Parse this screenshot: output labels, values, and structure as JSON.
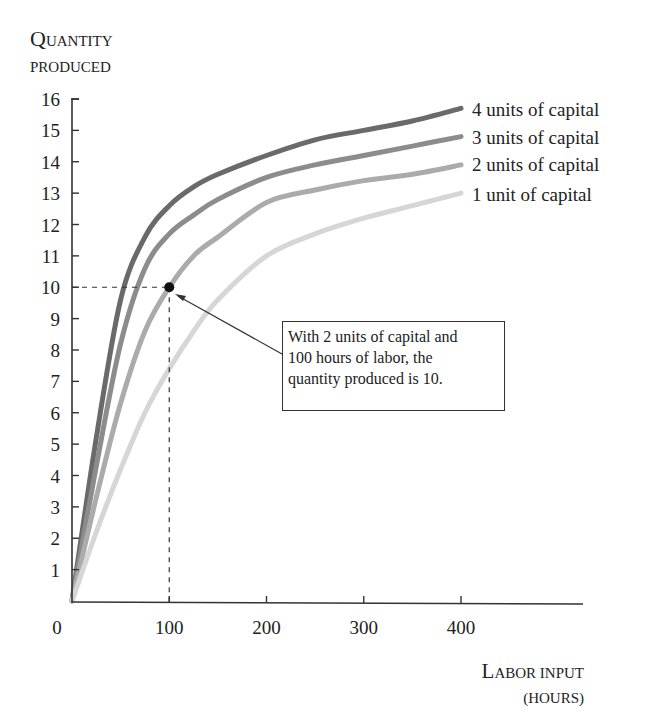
{
  "chart_data": {
    "type": "line",
    "title": "",
    "ylabel": "Quantity produced",
    "ylabel_lines": [
      "QUANTITY",
      "PRODUCED"
    ],
    "xlabel": "Labor input (hours)",
    "xlabel_lines": [
      "LABOR INPUT",
      "(HOURS)"
    ],
    "xlim": [
      0,
      520
    ],
    "ylim": [
      0,
      16
    ],
    "x_ticks": [
      0,
      100,
      200,
      300,
      400
    ],
    "y_ticks": [
      1,
      2,
      3,
      4,
      5,
      6,
      7,
      8,
      9,
      10,
      11,
      12,
      13,
      14,
      15,
      16
    ],
    "grid": false,
    "legend_position": "right end of curves",
    "x": [
      0,
      25,
      50,
      75,
      100,
      125,
      150,
      200,
      250,
      300,
      350,
      400
    ],
    "series": [
      {
        "name": "4 units of capital",
        "color": "#6a6a6a",
        "values": [
          0,
          5.2,
          9.6,
          11.6,
          12.6,
          13.2,
          13.6,
          14.2,
          14.7,
          15.0,
          15.3,
          15.7
        ]
      },
      {
        "name": "3 units of capital",
        "color": "#8c8c8c",
        "values": [
          0,
          4.3,
          8.2,
          10.6,
          11.7,
          12.3,
          12.8,
          13.5,
          13.9,
          14.2,
          14.5,
          14.8
        ]
      },
      {
        "name": "2 units of capital",
        "color": "#ababab",
        "values": [
          0,
          3.3,
          6.3,
          8.6,
          10.0,
          11.0,
          11.6,
          12.7,
          13.1,
          13.4,
          13.6,
          13.9
        ]
      },
      {
        "name": "1 unit of capital",
        "color": "#d6d6d6",
        "values": [
          0,
          2.2,
          4.2,
          6.0,
          7.4,
          8.6,
          9.6,
          11.0,
          11.7,
          12.2,
          12.6,
          13.0
        ]
      }
    ],
    "highlight_point": {
      "x": 100,
      "y": 10,
      "series": "2 units of capital"
    },
    "annotations": [
      {
        "text": "With 2 units of capital and 100 hours of labor, the quantity produced is 10.",
        "points_to": [
          100,
          10
        ]
      }
    ]
  },
  "labels": {
    "y_title_line1_big": "Q",
    "y_title_line1_rest": "UANTITY",
    "y_title_line2": "PRODUCED",
    "x_title_line1_big": "L",
    "x_title_line1_rest": "ABOR INPUT",
    "x_title_line2": "(HOURS)",
    "origin": "0"
  },
  "annotation": {
    "lines": [
      "With 2 units of capital and",
      "100 hours of labor, the",
      "quantity produced is 10."
    ]
  }
}
